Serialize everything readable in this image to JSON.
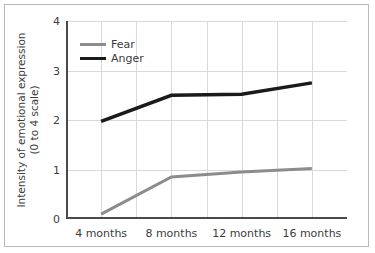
{
  "chart_data": {
    "type": "line",
    "title": "",
    "xlabel": "",
    "ylabel": "Intensity of emotional expression (0 to 4 scale)",
    "ylabel_line1": "Intensity of emotional expression",
    "ylabel_line2": "(0 to 4 scale)",
    "categories": [
      "4 months",
      "8 months",
      "12 months",
      "16 months"
    ],
    "ylim": [
      0,
      4
    ],
    "yticks": [
      0,
      1,
      2,
      3,
      4
    ],
    "ytick_labels": [
      "0",
      "1",
      "2",
      "3",
      "4"
    ],
    "grid": true,
    "grid_vertical_count": 8,
    "legend_position": "upper-left-inside",
    "series": [
      {
        "name": "Fear",
        "color": "#8c8c8c",
        "width": 3,
        "values": [
          0.1,
          0.85,
          0.95,
          1.02
        ]
      },
      {
        "name": "Anger",
        "color": "#1a1a1a",
        "width": 3.5,
        "values": [
          1.97,
          2.5,
          2.52,
          2.75
        ]
      }
    ]
  },
  "style": {
    "grid_color": "#d9d9d9",
    "axis_color": "#4a4a4a",
    "frame_color": "#b8b8b8",
    "background": "#ffffff",
    "text_color": "#3c3c3c"
  }
}
